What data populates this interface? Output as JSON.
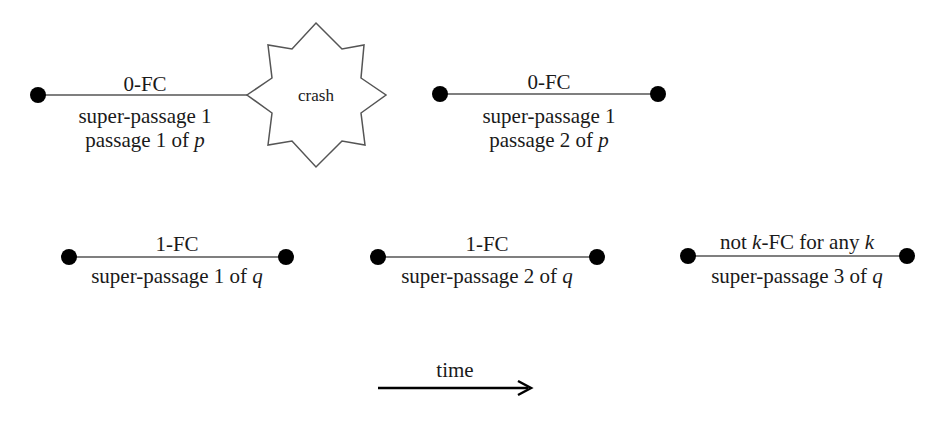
{
  "segments": [
    {
      "id": "p-super1-passage1",
      "above": "0-FC",
      "below1": "super-passage 1",
      "below2_prefix": "passage 1 of ",
      "below2_var": "p",
      "ends_in": "crash"
    },
    {
      "id": "p-super1-passage2",
      "above": "0-FC",
      "below1": "super-passage 1",
      "below2_prefix": "passage 2 of ",
      "below2_var": "p"
    },
    {
      "id": "q-super1",
      "above": "1-FC",
      "below_prefix": "super-passage 1 of ",
      "below_var": "q"
    },
    {
      "id": "q-super2",
      "above": "1-FC",
      "below_prefix": "super-passage 2 of ",
      "below_var": "q"
    },
    {
      "id": "q-super3",
      "above_prefix": "not ",
      "above_var1": "k",
      "above_mid": "-FC for any ",
      "above_var2": "k",
      "below_prefix": "super-passage 3 of ",
      "below_var": "q"
    }
  ],
  "crash_label": "crash",
  "time_label": "time"
}
